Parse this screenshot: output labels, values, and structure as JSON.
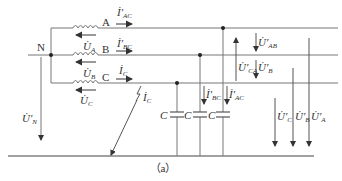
{
  "diagram": {
    "caption": "（a）",
    "node_neutral": "N",
    "phases": [
      {
        "name": "A",
        "current": "İ′",
        "current_sub": "AC",
        "source_voltage": "U̇",
        "source_voltage_sub": "A"
      },
      {
        "name": "B",
        "current": "İ′",
        "current_sub": "BC",
        "source_voltage": "U̇",
        "source_voltage_sub": "B"
      },
      {
        "name": "C",
        "current": "İ",
        "current_sub": "C",
        "source_voltage": "U̇",
        "source_voltage_sub": "C"
      }
    ],
    "neutral_voltage": {
      "main": "U̇′",
      "sub": "N"
    },
    "fault_current": {
      "main": "İ",
      "sub": "C"
    },
    "capacitor_label": "C",
    "capacitor_currents": [
      {
        "main": "İ′",
        "sub": "BC"
      },
      {
        "main": "İ′",
        "sub": "AC"
      }
    ],
    "line_voltages": [
      {
        "main": "U̇′",
        "sub": "AB"
      },
      {
        "main": "U̇′",
        "sub": "CA"
      },
      {
        "main": "U̇′",
        "sub": "B"
      }
    ],
    "phase_to_ground_voltages": [
      {
        "main": "U̇′",
        "sub": "C"
      },
      {
        "main": "U̇′",
        "sub": "B"
      },
      {
        "main": "U̇′",
        "sub": "A"
      }
    ],
    "colors": {
      "line": "#666666",
      "text": "#333333",
      "background": "#ffffff"
    }
  }
}
